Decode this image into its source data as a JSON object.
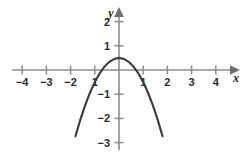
{
  "chart_data": {
    "type": "line",
    "title": "",
    "xlabel": "x",
    "ylabel": "y",
    "equation": "y = 0.5 - x^2",
    "grid": false,
    "legend": null,
    "xlim": [
      -4.4,
      4.9
    ],
    "ylim": [
      -3.6,
      2.4
    ],
    "xticks": [
      -4,
      -3,
      -2,
      -1,
      1,
      2,
      3,
      4
    ],
    "yticks": [
      2,
      1,
      -1,
      -2,
      -3
    ],
    "xtick_labels": [
      "−4",
      "−3",
      "−2",
      "1",
      "1",
      "2",
      "3",
      "4"
    ],
    "ytick_labels": [
      "2",
      "1",
      "−1",
      "−2",
      "−3"
    ],
    "vertex": [
      0,
      0.5
    ],
    "roots": [
      -0.707,
      0.707
    ],
    "series": [
      {
        "name": "parabola",
        "color": "#3a3a3a",
        "x": [
          -2.55,
          -2.4,
          -2.2,
          -2.0,
          -1.8,
          -1.6,
          -1.4,
          -1.2,
          -1.0,
          -0.8,
          -0.6,
          -0.4,
          -0.2,
          0.0,
          0.2,
          0.4,
          0.6,
          0.8,
          1.0,
          1.2,
          1.4,
          1.6,
          1.8,
          2.0,
          2.2,
          2.4,
          2.55,
          2.7
        ],
        "y": [
          -6.0,
          -5.26,
          -4.34,
          -3.5,
          -2.74,
          -2.06,
          -1.46,
          -0.94,
          -0.5,
          -0.14,
          0.14,
          0.34,
          0.46,
          0.5,
          0.46,
          0.34,
          0.14,
          -0.14,
          -0.5,
          -0.94,
          -1.46,
          -2.06,
          -2.74,
          -3.5,
          -4.34,
          -5.26,
          -6.0,
          -6.79
        ]
      }
    ]
  },
  "axis_labels": {
    "x_axis_name": "x",
    "y_axis_name": "y"
  },
  "colors": {
    "axis": "#8d8d8d",
    "curve": "#3a3a3a",
    "text": "#2b2b2b",
    "background": "#ffffff"
  }
}
